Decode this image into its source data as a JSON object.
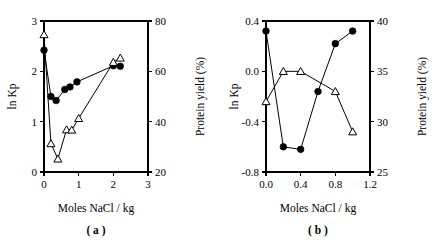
{
  "figure": {
    "panels": [
      "a",
      "b"
    ]
  },
  "chart_data": [
    {
      "type": "line",
      "panel_label": "( a )",
      "title": "",
      "xlabel": "Moles NaCl / kg",
      "ylabel": "ln Kp",
      "y2label": "Protein yield (%)",
      "xlim": [
        0,
        3
      ],
      "ylim": [
        0,
        3
      ],
      "y2lim": [
        20,
        80
      ],
      "xticks": [
        0,
        1,
        2,
        3
      ],
      "xticklabels": [
        "0",
        "1",
        "2",
        "3"
      ],
      "yticks": [
        0,
        1,
        2,
        3
      ],
      "yticklabels": [
        "0",
        "1",
        "2",
        "3"
      ],
      "y2ticks": [
        20,
        40,
        60,
        80
      ],
      "y2ticklabels": [
        "20",
        "40",
        "60",
        "80"
      ],
      "grid": false,
      "legend": "none",
      "series": [
        {
          "name": "ln Kp",
          "marker": "filled-circle",
          "axis": "left",
          "x": [
            0.0,
            0.2,
            0.35,
            0.6,
            0.75,
            0.95,
            2.0,
            2.2
          ],
          "values": [
            2.42,
            1.5,
            1.42,
            1.64,
            1.69,
            1.79,
            2.11,
            2.1
          ]
        },
        {
          "name": "Protein yield (%)",
          "marker": "open-triangle",
          "axis": "right",
          "x": [
            0.0,
            0.2,
            0.4,
            0.65,
            0.8,
            1.0,
            2.0,
            2.2
          ],
          "values": [
            74.6,
            31.3,
            25.2,
            36.8,
            36.7,
            41.3,
            63.6,
            65.3
          ]
        }
      ]
    },
    {
      "type": "line",
      "panel_label": "( b )",
      "title": "",
      "xlabel": "Moles NaCl / kg",
      "ylabel": "ln Kp",
      "y2label": "Protein yield (%)",
      "xlim": [
        0.0,
        1.2
      ],
      "ylim": [
        -0.8,
        0.4
      ],
      "y2lim": [
        25,
        40
      ],
      "xticks": [
        0.0,
        0.4,
        0.8,
        1.2
      ],
      "xticklabels": [
        "0.0",
        "0.4",
        "0.8",
        "1.2"
      ],
      "yticks": [
        -0.8,
        -0.4,
        0.0,
        0.4
      ],
      "yticklabels": [
        "-0.8",
        "-0.4",
        "0.0",
        "0.4"
      ],
      "y2ticks": [
        25,
        30,
        35,
        40
      ],
      "y2ticklabels": [
        "25",
        "30",
        "35",
        "40"
      ],
      "grid": false,
      "legend": "none",
      "series": [
        {
          "name": "ln Kp",
          "marker": "filled-circle",
          "axis": "left",
          "x": [
            0.0,
            0.2,
            0.4,
            0.6,
            0.8,
            1.0
          ],
          "values": [
            0.32,
            -0.6,
            -0.62,
            -0.16,
            0.22,
            0.32
          ]
        },
        {
          "name": "Protein yield (%)",
          "marker": "open-triangle",
          "axis": "right",
          "x": [
            0.0,
            0.2,
            0.4,
            0.8,
            1.0
          ],
          "values": [
            32.0,
            35.0,
            35.0,
            33.0,
            29.0
          ]
        }
      ]
    }
  ]
}
